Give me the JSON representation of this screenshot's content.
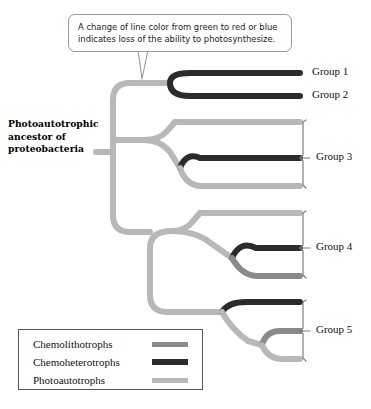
{
  "callout": {
    "text": "A change of line color from green to red or blue indicates loss of the ability to photosynthesize."
  },
  "ancestor": {
    "label": "Photoautotrophic ancestor of proteobacteria"
  },
  "colors": {
    "photoautotroph": "#b8b8b8",
    "chemolithotroph": "#8a8a8a",
    "chemoheterotroph": "#2b2b2b",
    "bracket": "#7d7d7d",
    "callout_border": "#9a9a9a",
    "legend_border": "#555555",
    "text": "#111111"
  },
  "groups": [
    {
      "id": "group-1",
      "label": "Group 1",
      "x": 312,
      "y": 73
    },
    {
      "id": "group-2",
      "label": "Group 2",
      "x": 312,
      "y": 96
    },
    {
      "id": "group-3",
      "label": "Group 3",
      "x": 318,
      "y": 158
    },
    {
      "id": "group-4",
      "label": "Group 4",
      "x": 318,
      "y": 248
    },
    {
      "id": "group-5",
      "label": "Group 5",
      "x": 318,
      "y": 331
    }
  ],
  "legend": {
    "items": [
      {
        "label": "Chemolithotrophs",
        "color": "#8a8a8a",
        "thickness": 5
      },
      {
        "label": "Chemoheterotrophs",
        "color": "#2b2b2b",
        "thickness": 6
      },
      {
        "label": "Photoautotrophs",
        "color": "#b8b8b8",
        "thickness": 5
      }
    ]
  },
  "tree": {
    "root_stem": {
      "from_x": 96,
      "to_x": 112,
      "y": 152,
      "color": "#b8b8b8"
    },
    "tips": [
      {
        "name": "tip-group1",
        "y": 73,
        "end_x": 300,
        "color": "#2b2b2b"
      },
      {
        "name": "tip-group2",
        "y": 96,
        "end_x": 300,
        "color": "#2b2b2b"
      },
      {
        "name": "tip-group3-a",
        "y": 122,
        "end_x": 300,
        "color": "#b8b8b8"
      },
      {
        "name": "tip-group3-b",
        "y": 158,
        "end_x": 300,
        "color": "#2b2b2b"
      },
      {
        "name": "tip-group3-c",
        "y": 186,
        "end_x": 300,
        "color": "#b8b8b8"
      },
      {
        "name": "tip-group4-a",
        "y": 213,
        "end_x": 300,
        "color": "#b8b8b8"
      },
      {
        "name": "tip-group4-b",
        "y": 248,
        "end_x": 300,
        "color": "#2b2b2b"
      },
      {
        "name": "tip-group4-c",
        "y": 276,
        "end_x": 300,
        "color": "#8a8a8a"
      },
      {
        "name": "tip-group5-a",
        "y": 302,
        "end_x": 300,
        "color": "#2b2b2b"
      },
      {
        "name": "tip-group5-b",
        "y": 331,
        "end_x": 300,
        "color": "#8a8a8a"
      },
      {
        "name": "tip-group5-c",
        "y": 359,
        "end_x": 300,
        "color": "#b8b8b8"
      }
    ],
    "brackets": [
      {
        "name": "bracket-group3",
        "x": 303,
        "top": 122,
        "bottom": 186,
        "tick_y": 158
      },
      {
        "name": "bracket-group4",
        "x": 303,
        "top": 213,
        "bottom": 276,
        "tick_y": 248
      },
      {
        "name": "bracket-group5",
        "x": 303,
        "top": 302,
        "bottom": 359,
        "tick_y": 331
      }
    ]
  }
}
